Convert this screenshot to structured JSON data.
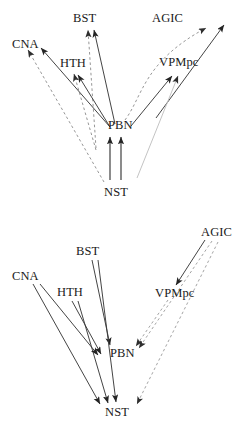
{
  "figure": {
    "width": 249,
    "height": 437,
    "background": "#ffffff",
    "ink_color": "#2a2a2a",
    "dashed_color": "#777777",
    "faint_color": "#b5b5b5"
  },
  "panels": [
    {
      "id": "top",
      "name": "ascending-projections-diagram",
      "nodes": [
        {
          "id": "CNA",
          "label": "CNA",
          "x": 12,
          "y": 38
        },
        {
          "id": "BST",
          "label": "BST",
          "x": 73,
          "y": 12
        },
        {
          "id": "HTH",
          "label": "HTH",
          "x": 60,
          "y": 57
        },
        {
          "id": "AGIC",
          "label": "AGIC",
          "x": 152,
          "y": 12
        },
        {
          "id": "VPMpc",
          "label": "VPMpc",
          "x": 159,
          "y": 56
        },
        {
          "id": "PBN",
          "label": "PBN",
          "x": 108,
          "y": 119
        },
        {
          "id": "NST",
          "label": "NST",
          "x": 104,
          "y": 186
        }
      ],
      "edges": [
        {
          "from": "PBN",
          "to": "CNA",
          "style": "solid",
          "name": "edge-pbn-cna"
        },
        {
          "from": "PBN",
          "to": "HTH",
          "style": "solid",
          "name": "edge-pbn-hth"
        },
        {
          "from": "PBN",
          "to": "BST",
          "style": "solid",
          "name": "edge-pbn-bst"
        },
        {
          "from": "PBN",
          "to": "VPMpc",
          "style": "solid",
          "name": "edge-pbn-vpmpc"
        },
        {
          "from": "PBN",
          "to": "AGIC",
          "style": "dashed",
          "name": "edge-pbn-agic"
        },
        {
          "from": "NST",
          "to": "PBN",
          "style": "solid",
          "name": "edge-nst-pbn-a"
        },
        {
          "from": "NST",
          "to": "PBN",
          "style": "solid",
          "name": "edge-nst-pbn-b"
        },
        {
          "from": "NST",
          "to": "CNA",
          "style": "dashed",
          "name": "edge-nst-cna"
        },
        {
          "from": "NST",
          "to": "HTH",
          "style": "dashed",
          "name": "edge-nst-hth"
        },
        {
          "from": "NST",
          "to": "BST",
          "style": "dashed",
          "name": "edge-nst-bst"
        },
        {
          "from": "NST",
          "to": "VPMpc",
          "style": "faint",
          "name": "edge-nst-vpmpc"
        },
        {
          "from": "NST",
          "to": "AGIC",
          "style": "solid",
          "name": "edge-nst-agic"
        }
      ]
    },
    {
      "id": "bottom",
      "name": "descending-projections-diagram",
      "nodes": [
        {
          "id": "AGIC",
          "label": "AGIC",
          "x": 201,
          "y": 14
        },
        {
          "id": "BST",
          "label": "BST",
          "x": 76,
          "y": 33
        },
        {
          "id": "CNA",
          "label": "CNA",
          "x": 12,
          "y": 58
        },
        {
          "id": "HTH",
          "label": "HTH",
          "x": 57,
          "y": 74
        },
        {
          "id": "VPMpc",
          "label": "VPMpc",
          "x": 155,
          "y": 75
        },
        {
          "id": "PBN",
          "label": "PBN",
          "x": 110,
          "y": 135
        },
        {
          "id": "NST",
          "label": "NST",
          "x": 105,
          "y": 194
        }
      ],
      "edges": [
        {
          "from": "AGIC",
          "to": "VPMpc",
          "style": "solid",
          "name": "edge-agic-vpmpc"
        },
        {
          "from": "AGIC",
          "to": "PBN",
          "style": "dashed",
          "name": "edge-agic-pbn"
        },
        {
          "from": "AGIC",
          "to": "NST",
          "style": "dashed",
          "name": "edge-agic-nst"
        },
        {
          "from": "VPMpc",
          "to": "PBN",
          "style": "dashed",
          "name": "edge-vpmpc-pbn"
        },
        {
          "from": "BST",
          "to": "PBN",
          "style": "solid",
          "name": "edge-bst-pbn"
        },
        {
          "from": "BST",
          "to": "NST",
          "style": "solid",
          "name": "edge-bst-nst"
        },
        {
          "from": "HTH",
          "to": "PBN",
          "style": "solid",
          "name": "edge-hth-pbn"
        },
        {
          "from": "HTH",
          "to": "NST",
          "style": "solid",
          "name": "edge-hth-nst"
        },
        {
          "from": "CNA",
          "to": "PBN",
          "style": "solid",
          "name": "edge-cna-pbn"
        },
        {
          "from": "CNA",
          "to": "NST",
          "style": "solid",
          "name": "edge-cna-nst"
        }
      ]
    }
  ]
}
